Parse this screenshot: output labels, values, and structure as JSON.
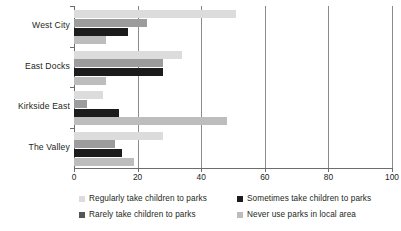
{
  "chart_data": {
    "type": "bar",
    "orientation": "horizontal",
    "title": "",
    "subtitle": "",
    "xlabel": "",
    "ylabel": "",
    "xlim": [
      0,
      100
    ],
    "xticks": [
      0,
      20,
      40,
      60,
      80,
      100
    ],
    "grid": true,
    "legend_position": "bottom",
    "categories": [
      "West City",
      "East Docks",
      "Kirkside East",
      "The Valley"
    ],
    "series": [
      {
        "name": "Regularly take children to parks",
        "color": "#dcdcdc",
        "values": [
          51,
          34,
          9,
          28
        ]
      },
      {
        "name": "Sometimes take children to parks",
        "color": "#9c9c9c",
        "values": [
          23,
          28,
          4,
          13
        ]
      },
      {
        "name": "Rarely take children to parks",
        "color": "#1c1c1c",
        "values": [
          17,
          28,
          14,
          15
        ]
      },
      {
        "name": "Never use parks in local area",
        "color": "#bdbdbd",
        "values": [
          10,
          10,
          48,
          19
        ]
      }
    ]
  },
  "legend": {
    "items": [
      {
        "label": "Regularly take children to parks",
        "swatch": "#dcdcdc"
      },
      {
        "label": "Sometimes take children to parks",
        "swatch": "#1c1c1c"
      },
      {
        "label": "Rarely take children to parks",
        "swatch": "#555555"
      },
      {
        "label": "Never use parks in local area",
        "swatch": "#bdbdbd"
      }
    ]
  },
  "axis": {
    "tick_labels": [
      "0",
      "20",
      "40",
      "60",
      "80",
      "100"
    ]
  }
}
